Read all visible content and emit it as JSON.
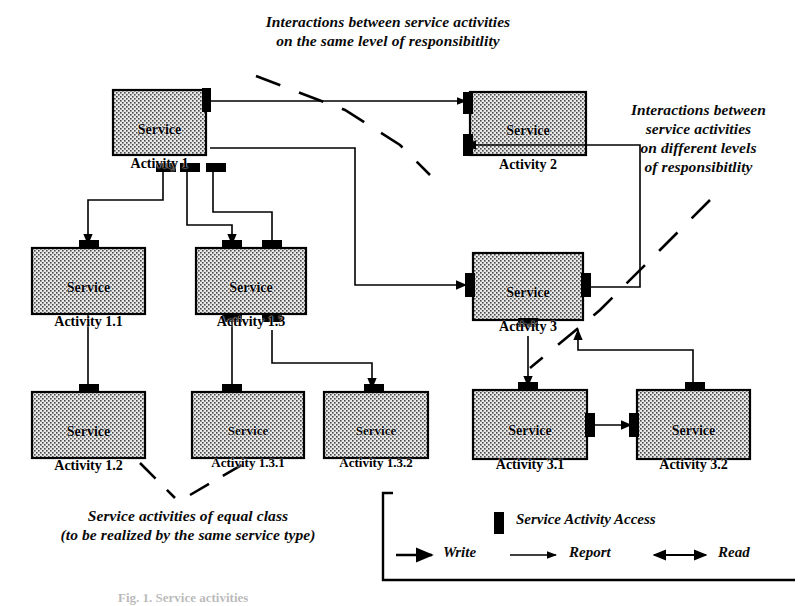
{
  "figure": {
    "caption": "Fig. 1. Service activities",
    "bg_color": "#ffffff",
    "ink_color": "#000000",
    "node_fill": "#d8d8d8"
  },
  "annotations": [
    {
      "id": "same-level",
      "text": "Interactions between service activities\non the same level of responsibitlity"
    },
    {
      "id": "different-levels",
      "text": "Interactions between\nservice activities\non different levels\nof responsibitlity"
    },
    {
      "id": "equal-class",
      "text": "Service activities of equal class\n(to be realized by the same service type)"
    }
  ],
  "nodes": [
    {
      "id": "sa1",
      "line1": "Service",
      "line2": "Activity 1"
    },
    {
      "id": "sa2",
      "line1": "Service",
      "line2": "Activity 2"
    },
    {
      "id": "sa11",
      "line1": "Service",
      "line2": "Activity 1.1"
    },
    {
      "id": "sa13",
      "line1": "Service",
      "line2": "Activity 1.3"
    },
    {
      "id": "sa3",
      "line1": "Service",
      "line2": "Activity 3"
    },
    {
      "id": "sa12",
      "line1": "Service",
      "line2": "Activity 1.2"
    },
    {
      "id": "sa131",
      "line1": "Service",
      "line2": "Activity 1.3.1"
    },
    {
      "id": "sa132",
      "line1": "Service",
      "line2": "Activity 1.3.2"
    },
    {
      "id": "sa31",
      "line1": "Service",
      "line2": "Activity 3.1"
    },
    {
      "id": "sa32",
      "line1": "Service",
      "line2": "Activity 3.2"
    }
  ],
  "legend": {
    "access_label": "Service Activity Access",
    "access_icon": "filled-rectangle-icon",
    "items": [
      {
        "id": "write",
        "label": "Write",
        "icon": "solid-arrow-icon"
      },
      {
        "id": "report",
        "label": "Report",
        "icon": "thin-arrow-icon"
      },
      {
        "id": "read",
        "label": "Read",
        "icon": "double-arrow-icon"
      }
    ]
  }
}
